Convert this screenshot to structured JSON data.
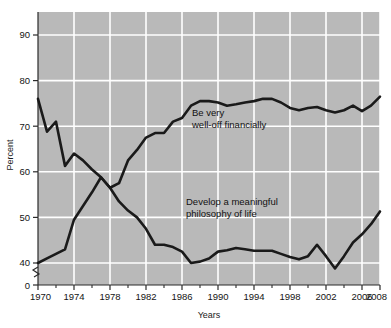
{
  "chart_data": {
    "type": "line",
    "title": "",
    "xlabel": "Years",
    "ylabel": "Percent",
    "xlim": [
      1970,
      2008
    ],
    "ylim": [
      38,
      95
    ],
    "y_axis_break": true,
    "y_break_label": "0",
    "grid": true,
    "legend_position": "inline-annotations",
    "background_color": "#b9b9b9",
    "gridline_color": "#ffffff",
    "line_color": "#1a1a1a",
    "yticks": [
      40,
      50,
      60,
      70,
      80,
      90
    ],
    "ytick_labels": [
      "40",
      "50",
      "60",
      "70",
      "80",
      "90"
    ],
    "xticks": [
      1970,
      1974,
      1978,
      1982,
      1986,
      1990,
      1994,
      1998,
      2002,
      2006,
      2008
    ],
    "xtick_labels": [
      "1970",
      "1974",
      "1978",
      "1982",
      "1986",
      "1990",
      "1994",
      "1998",
      "2002",
      "2006",
      "2008"
    ],
    "xminor_ticks": [
      1972,
      1976,
      1980,
      1984,
      1988,
      1992,
      1996,
      2000,
      2004
    ],
    "x": [
      1970,
      1971,
      1972,
      1973,
      1974,
      1975,
      1976,
      1977,
      1978,
      1979,
      1980,
      1981,
      1982,
      1983,
      1984,
      1985,
      1986,
      1987,
      1988,
      1989,
      1990,
      1991,
      1992,
      1993,
      1994,
      1995,
      1996,
      1997,
      1998,
      1999,
      2000,
      2001,
      2002,
      2003,
      2004,
      2005,
      2006,
      2007,
      2008
    ],
    "series": [
      {
        "name": "Be very well-off financially",
        "label_lines": [
          "Be very",
          "well-off financially"
        ],
        "values": [
          76.0,
          68.8,
          71.0,
          61.3,
          64.0,
          62.5,
          60.5,
          58.8,
          56.5,
          57.5,
          62.5,
          64.8,
          67.5,
          68.5,
          68.5,
          71.0,
          71.8,
          74.5,
          75.5,
          75.5,
          75.2,
          74.5,
          74.8,
          75.2,
          75.5,
          76.0,
          76.0,
          75.2,
          74.0,
          73.5,
          74.0,
          74.2,
          73.5,
          73.0,
          73.5,
          74.5,
          73.3,
          74.5,
          76.5
        ]
      },
      {
        "name": "Develop a meaningful philosophy of life",
        "label_lines": [
          "Develop a meaningful",
          "philosophy of life"
        ],
        "values": [
          40.0,
          41.0,
          42.0,
          43.0,
          49.5,
          52.5,
          55.5,
          58.8,
          56.5,
          53.5,
          51.5,
          50.0,
          47.5,
          44.0,
          44.0,
          43.5,
          42.5,
          40.0,
          40.3,
          41.0,
          42.5,
          42.8,
          43.3,
          43.0,
          42.7,
          42.7,
          42.7,
          42.0,
          41.3,
          40.8,
          41.5,
          44.0,
          41.5,
          38.8,
          41.5,
          44.5,
          46.3,
          48.5,
          51.3
        ]
      }
    ],
    "annotations": [
      {
        "id": "annotation-well-off",
        "lines": [
          "Be very",
          "well-off financially"
        ],
        "x_px": 192,
        "y_px": 116
      },
      {
        "id": "annotation-philosophy",
        "lines": [
          "Develop a meaningful",
          "philosophy of life"
        ],
        "x_px": 186,
        "y_px": 205
      }
    ]
  }
}
